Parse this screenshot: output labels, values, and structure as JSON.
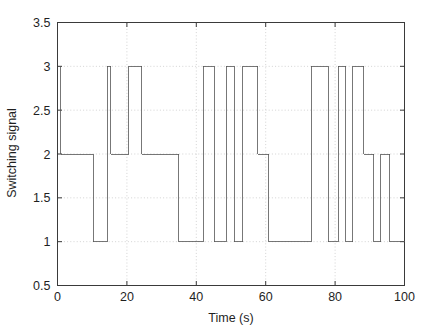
{
  "chart_data": {
    "type": "line",
    "title": "",
    "xlabel": "Time (s)",
    "ylabel": "Switching signal",
    "xlim": [
      0,
      100
    ],
    "ylim": [
      0.5,
      3.5
    ],
    "xticks": [
      0,
      20,
      40,
      60,
      80,
      100
    ],
    "yticks": [
      0.5,
      1,
      1.5,
      2,
      2.5,
      3,
      3.5
    ],
    "xticklabels": [
      "0",
      "20",
      "40",
      "60",
      "80",
      "100"
    ],
    "yticklabels": [
      "0.5",
      "1",
      "1.5",
      "2",
      "2.5",
      "3",
      "3.5"
    ],
    "grid": true,
    "grid_style": "dotted",
    "line_color": "#555555",
    "line_width": 0.8,
    "drawstyle": "steps-post",
    "series": [
      {
        "name": "Switching signal",
        "x": [
          0.0,
          0.9,
          10.3,
          10.9,
          14.3,
          15.4,
          16.3,
          20.6,
          21.4,
          24.3,
          25.4,
          35.0,
          36.1,
          42.0,
          43.1,
          45.1,
          46.1,
          48.6,
          49.4,
          50.9,
          51.7,
          53.4,
          54.3,
          57.7,
          58.6,
          60.9,
          61.7,
          73.1,
          74.0,
          78.0,
          79.1,
          80.9,
          81.7,
          83.1,
          84.0,
          85.1,
          86.0,
          88.3,
          89.1,
          91.1,
          92.0,
          93.1,
          94.0,
          95.7,
          96.6,
          100.0
        ],
        "y": [
          3,
          2,
          2,
          1,
          1,
          3,
          2,
          2,
          3,
          3,
          2,
          2,
          1,
          1,
          3,
          3,
          1,
          1,
          3,
          3,
          1,
          1,
          3,
          3,
          2,
          2,
          1,
          1,
          3,
          3,
          1,
          1,
          3,
          3,
          1,
          1,
          3,
          3,
          2,
          2,
          1,
          1,
          2,
          2,
          1,
          1
        ]
      }
    ],
    "segments": [
      {
        "t_start": 0.0,
        "t_end": 0.9,
        "value": 3
      },
      {
        "t_start": 0.9,
        "t_end": 10.3,
        "value": 2
      },
      {
        "t_start": 10.3,
        "t_end": 14.3,
        "value": 1
      },
      {
        "t_start": 14.3,
        "t_end": 15.4,
        "value": 3
      },
      {
        "t_start": 15.4,
        "t_end": 16.3,
        "value": 2
      },
      {
        "t_start": 16.3,
        "t_end": 20.6,
        "value": 2
      },
      {
        "t_start": 20.6,
        "t_end": 24.3,
        "value": 3
      },
      {
        "t_start": 24.3,
        "t_end": 35.0,
        "value": 2
      },
      {
        "t_start": 35.0,
        "t_end": 42.0,
        "value": 1
      },
      {
        "t_start": 42.0,
        "t_end": 45.1,
        "value": 3
      },
      {
        "t_start": 45.1,
        "t_end": 48.6,
        "value": 1
      },
      {
        "t_start": 48.6,
        "t_end": 50.9,
        "value": 3
      },
      {
        "t_start": 50.9,
        "t_end": 53.4,
        "value": 1
      },
      {
        "t_start": 53.4,
        "t_end": 57.7,
        "value": 3
      },
      {
        "t_start": 57.7,
        "t_end": 60.9,
        "value": 2
      },
      {
        "t_start": 60.9,
        "t_end": 73.1,
        "value": 1
      },
      {
        "t_start": 73.1,
        "t_end": 78.0,
        "value": 3
      },
      {
        "t_start": 78.0,
        "t_end": 80.9,
        "value": 1
      },
      {
        "t_start": 80.9,
        "t_end": 83.1,
        "value": 3
      },
      {
        "t_start": 83.1,
        "t_end": 85.1,
        "value": 1
      },
      {
        "t_start": 85.1,
        "t_end": 88.3,
        "value": 3
      },
      {
        "t_start": 88.3,
        "t_end": 91.1,
        "value": 2
      },
      {
        "t_start": 91.1,
        "t_end": 93.1,
        "value": 1
      },
      {
        "t_start": 93.1,
        "t_end": 95.7,
        "value": 2
      },
      {
        "t_start": 95.7,
        "t_end": 100.0,
        "value": 1
      }
    ]
  },
  "axes": {
    "x_label": "Time (s)",
    "y_label": "Switching signal",
    "x_tick_labels": [
      "0",
      "20",
      "40",
      "60",
      "80",
      "100"
    ],
    "y_tick_labels": [
      "0.5",
      "1",
      "1.5",
      "2",
      "2.5",
      "3",
      "3.5"
    ]
  },
  "style": {
    "background": "#ffffff",
    "axis_color": "#3a3a3a",
    "grid_color": "#c8c8c8",
    "line_color": "#555555"
  }
}
